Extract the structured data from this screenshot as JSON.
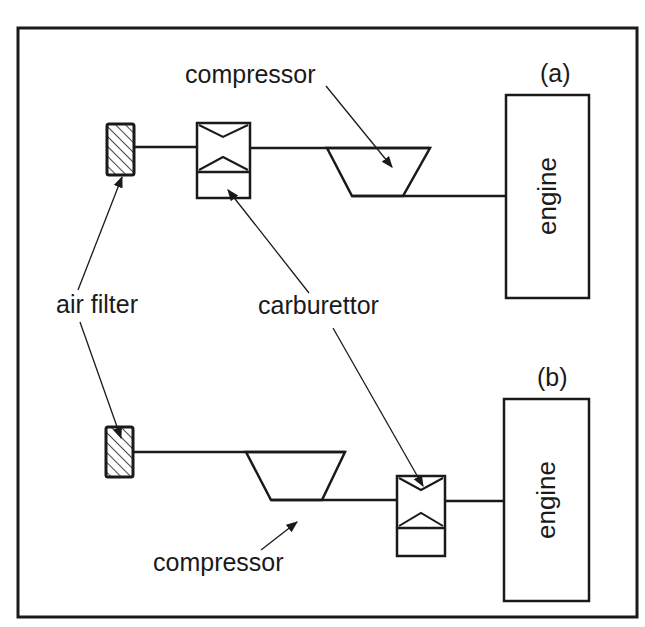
{
  "figure": {
    "panels": [
      {
        "id": "a",
        "tag": "(a)",
        "order": [
          "air filter",
          "carburettor",
          "compressor",
          "engine"
        ]
      },
      {
        "id": "b",
        "tag": "(b)",
        "order": [
          "air filter",
          "compressor",
          "carburettor",
          "engine"
        ]
      }
    ],
    "labels": {
      "air_filter": "air filter",
      "carburettor": "carburettor",
      "compressor_a": "compressor",
      "compressor_b": "compressor",
      "engine_a": "engine",
      "engine_b": "engine",
      "tag_a": "(a)",
      "tag_b": "(b)"
    },
    "colors": {
      "ink": "#1a1a1a",
      "background": "#ffffff"
    }
  }
}
